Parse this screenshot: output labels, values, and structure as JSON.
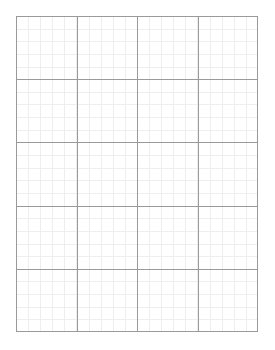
{
  "page": {
    "width": 275,
    "height": 350,
    "background_color": "#ffffff"
  },
  "grid": {
    "name": "graph-paper",
    "origin_x": 16,
    "origin_y": 16,
    "width": 242,
    "height": 316,
    "columns": 4,
    "rows": 5,
    "major_cell_width": 60.5,
    "major_cell_height": 63.2,
    "minor_divisions_per_major": 5,
    "minor_cell_width": 12.1,
    "minor_cell_height": 12.64,
    "major_line_color": "#9a9a9a",
    "minor_line_color": "#eeeeee",
    "border_color": "#9a9a9a",
    "major_line_width": 1,
    "minor_line_width": 1,
    "border_width": 1,
    "major_vertical_positions": [
      16,
      76.5,
      137,
      197.5,
      258
    ],
    "major_horizontal_positions": [
      16,
      79.2,
      142.4,
      205.6,
      268.8,
      332
    ]
  },
  "chart_data": {
    "type": "table",
    "xlabel": "",
    "ylabel": "",
    "categories": [
      "col-1",
      "col-2",
      "col-3",
      "col-4"
    ],
    "values": [
      0,
      0,
      0,
      0
    ],
    "grid": true,
    "legend": "none",
    "xlim": [
      0,
      4
    ],
    "ylim": [
      0,
      5
    ]
  }
}
